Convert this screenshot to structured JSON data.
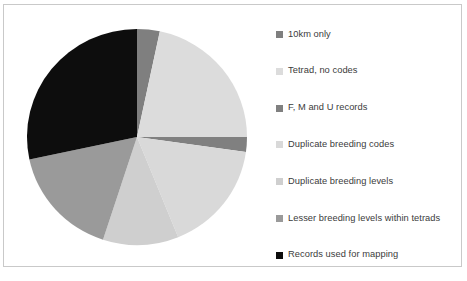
{
  "chart_data": {
    "type": "pie",
    "title": "",
    "legend_position": "right",
    "grid": false,
    "categories": [
      "10km only",
      "Tetrad, no codes",
      "F, M and U records",
      "Duplicate breeding codes",
      "Duplicate breeding levels",
      "Lesser breeding levels within tetrads",
      "Records used for mapping"
    ],
    "values": [
      3.3,
      21.7,
      2.2,
      16.7,
      11.1,
      16.7,
      28.3
    ],
    "units": "percent",
    "angles_deg": [
      12,
      78,
      8,
      60,
      40,
      60,
      102
    ],
    "colors": [
      "#7f7f7f",
      "#dcdcdc",
      "#808080",
      "#d9d9d9",
      "#cfcfcf",
      "#9a9a9a",
      "#0d0d0d"
    ],
    "start_angle_deg": 0,
    "direction": "clockwise"
  },
  "legend": {
    "items": [
      {
        "label": "10km only",
        "color": "#7f7f7f"
      },
      {
        "label": "Tetrad, no codes",
        "color": "#dcdcdc"
      },
      {
        "label": "F, M and U records",
        "color": "#808080"
      },
      {
        "label": "Duplicate breeding codes",
        "color": "#d9d9d9"
      },
      {
        "label": "Duplicate breeding levels",
        "color": "#cfcfcf"
      },
      {
        "label": "Lesser breeding levels within tetrads",
        "color": "#9a9a9a"
      },
      {
        "label": "Records used for mapping",
        "color": "#0d0d0d"
      }
    ]
  },
  "frame": {
    "border_color": "#c9c9c9",
    "background": "#ffffff"
  }
}
